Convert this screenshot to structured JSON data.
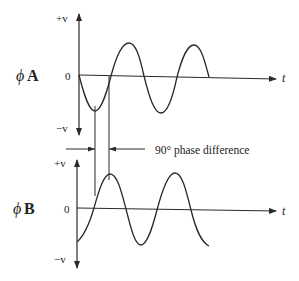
{
  "diagram": {
    "colors": {
      "line": "#2a2a2a",
      "background": "#ffffff"
    },
    "phase_a": {
      "label_symbol": "ϕ",
      "label_letter": "A",
      "plus_v": "+v",
      "minus_v": "−v",
      "zero": "0",
      "t_label": "t"
    },
    "phase_b": {
      "label_symbol": "ϕ",
      "label_letter": "B",
      "plus_v": "+v",
      "minus_v": "−v",
      "zero": "0",
      "t_label": "t"
    },
    "annotation": "90° phase difference"
  }
}
